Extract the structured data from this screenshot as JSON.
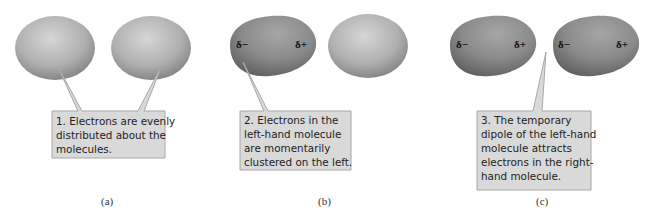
{
  "panels": [
    {
      "id": "a",
      "caption": "(a)",
      "callout": [
        "1. Electrons are evenly",
        "distributed about the",
        "molecules."
      ],
      "molecules": [
        {
          "state": "neutral",
          "labels": []
        },
        {
          "state": "neutral",
          "labels": []
        }
      ]
    },
    {
      "id": "b",
      "caption": "(b)",
      "callout": [
        "2. Electrons in the",
        "left-hand molecule",
        "are momentarily",
        "clustered on the left."
      ],
      "molecules": [
        {
          "state": "polarized",
          "labels": [
            "δ−",
            "δ+"
          ]
        },
        {
          "state": "neutral",
          "labels": []
        }
      ]
    },
    {
      "id": "c",
      "caption": "(c)",
      "callout": [
        "3. The temporary",
        "dipole of the left-hand",
        "molecule attracts",
        "electrons in the right-",
        "hand molecule."
      ],
      "molecules": [
        {
          "state": "polarized",
          "labels": [
            "δ−",
            "δ+"
          ]
        },
        {
          "state": "polarized",
          "labels": [
            "δ−",
            "δ+"
          ]
        }
      ]
    }
  ],
  "colors": {
    "neutral_molecule": "#a9a9a9",
    "polarized_molecule": "#8a8a8a",
    "callout_fill": "#d9d9d9",
    "callout_border": "#a0a0a0"
  }
}
